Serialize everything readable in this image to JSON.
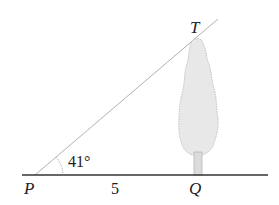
{
  "diagram": {
    "points": {
      "P": {
        "label": "P"
      },
      "Q": {
        "label": "Q"
      },
      "T": {
        "label": "T"
      }
    },
    "angle_label": "41°",
    "distance_label": "5",
    "colors": {
      "ground": "#333333",
      "sightline": "#9a9a9a",
      "tree_fill": "#e6e6e6",
      "tree_stroke": "#b5b5b5",
      "text": "#222222"
    }
  }
}
